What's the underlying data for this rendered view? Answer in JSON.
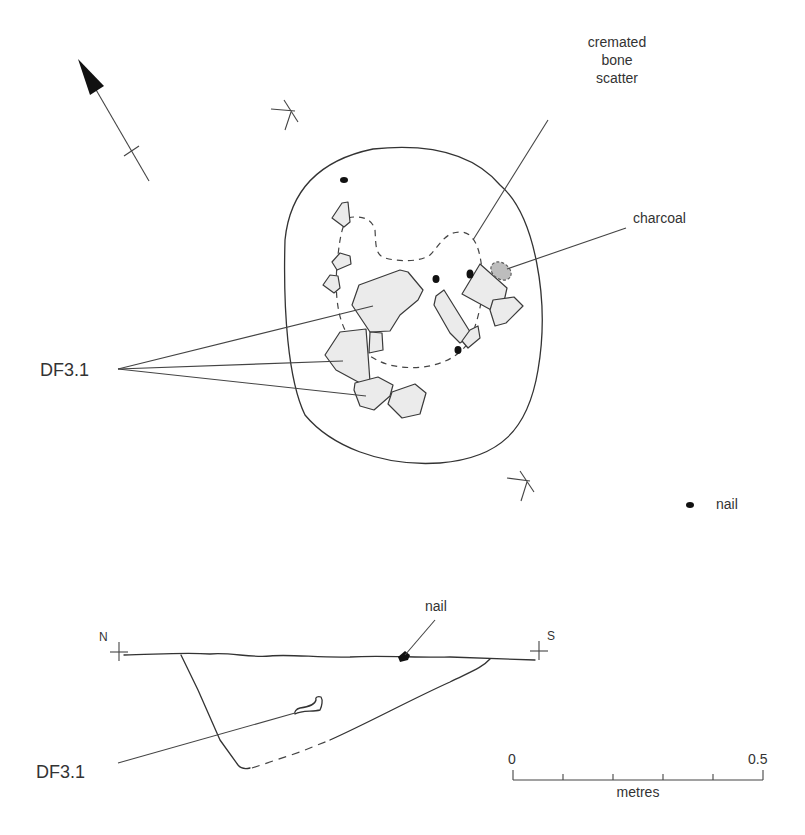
{
  "plan": {
    "labels": {
      "cremated_bone": [
        "cremated",
        "bone",
        "scatter"
      ],
      "charcoal": "charcoal",
      "find": "DF3.1",
      "nail": "nail"
    },
    "north_arrow": "north-arrow"
  },
  "section": {
    "north_label": "N",
    "south_label": "S",
    "nail_label": "nail",
    "find_label": "DF3.1"
  },
  "scale_bar": {
    "start_label": "0",
    "end_label": "0.5",
    "unit_label": "metres",
    "range_m": [
      0,
      0.5
    ],
    "divisions": 5
  },
  "colors": {
    "stone_fill": "#ebebeb",
    "charcoal_fill": "#bdbdbd",
    "line": "#333333"
  }
}
